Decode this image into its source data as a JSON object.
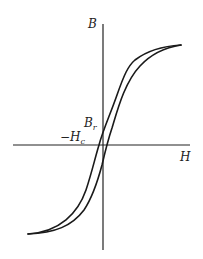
{
  "diagram": {
    "labels": {
      "y_axis": "B",
      "x_axis": "H",
      "remanence": "B",
      "remanence_sub": "r",
      "coercivity_minus": "−H",
      "coercivity_sub": "c"
    },
    "colors": {
      "line": "#1a1a1a",
      "background": "#ffffff"
    }
  }
}
